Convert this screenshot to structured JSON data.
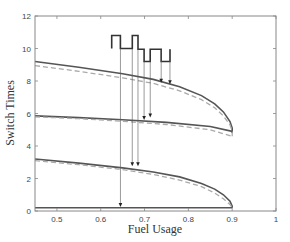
{
  "chart_data": {
    "type": "line",
    "title": "",
    "xlabel": "Fuel Usage",
    "ylabel": "Switch Times",
    "xlim": [
      0.45,
      1.0
    ],
    "ylim": [
      0,
      12
    ],
    "xticks": [
      0.5,
      0.6,
      0.7,
      0.8,
      0.9,
      1
    ],
    "xtick_labels": [
      "0.5",
      "0.6",
      "0.7",
      "0.8",
      "0.9",
      "1"
    ],
    "yticks": [
      0,
      2,
      4,
      6,
      8,
      10,
      12
    ],
    "ytick_labels": [
      "0",
      "2",
      "4",
      "6",
      "8",
      "10",
      "12"
    ],
    "grid": false,
    "legend": null,
    "series": [
      {
        "name": "switch 4 (solid)",
        "style": "solid",
        "color": "#555555",
        "x": [
          0.45,
          0.55,
          0.65,
          0.72,
          0.78,
          0.83,
          0.86,
          0.88,
          0.895,
          0.9,
          0.9
        ],
        "y": [
          9.2,
          8.85,
          8.45,
          8.1,
          7.65,
          7.1,
          6.6,
          6.1,
          5.5,
          5.1,
          4.8
        ]
      },
      {
        "name": "switch 4 (dashed)",
        "style": "dashed",
        "color": "#aaaaaa",
        "x": [
          0.45,
          0.55,
          0.65,
          0.72,
          0.78,
          0.83,
          0.86,
          0.88,
          0.895,
          0.9,
          0.9
        ],
        "y": [
          8.95,
          8.6,
          8.2,
          7.85,
          7.4,
          6.85,
          6.35,
          5.85,
          5.3,
          4.9,
          4.6
        ]
      },
      {
        "name": "switch 3 (solid)",
        "style": "solid",
        "color": "#555555",
        "x": [
          0.45,
          0.55,
          0.65,
          0.75,
          0.85,
          0.9
        ],
        "y": [
          5.85,
          5.75,
          5.62,
          5.45,
          5.2,
          4.9
        ]
      },
      {
        "name": "switch 3 (dashed)",
        "style": "dashed",
        "color": "#aaaaaa",
        "x": [
          0.45,
          0.55,
          0.65,
          0.75,
          0.85,
          0.9
        ],
        "y": [
          5.8,
          5.68,
          5.52,
          5.32,
          5.0,
          4.6
        ]
      },
      {
        "name": "switch 2 (solid)",
        "style": "solid",
        "color": "#555555",
        "x": [
          0.45,
          0.55,
          0.65,
          0.72,
          0.78,
          0.83,
          0.86,
          0.88,
          0.895,
          0.9,
          0.9
        ],
        "y": [
          3.2,
          2.95,
          2.65,
          2.4,
          2.1,
          1.7,
          1.35,
          1.0,
          0.6,
          0.3,
          0.2
        ]
      },
      {
        "name": "switch 2 (dashed)",
        "style": "dashed",
        "color": "#aaaaaa",
        "x": [
          0.45,
          0.55,
          0.65,
          0.72,
          0.78,
          0.83,
          0.86,
          0.88,
          0.895,
          0.9
        ],
        "y": [
          3.1,
          2.85,
          2.55,
          2.25,
          1.9,
          1.5,
          1.1,
          0.75,
          0.4,
          0.2
        ]
      },
      {
        "name": "switch 1 (solid)",
        "style": "solid",
        "color": "#555555",
        "x": [
          0.45,
          0.9
        ],
        "y": [
          0.2,
          0.2
        ]
      }
    ],
    "annotation": {
      "description": "Square-wave control signal with arrows projecting switch instants onto curves",
      "wave_points": [
        [
          0.625,
          10.0
        ],
        [
          0.625,
          10.8
        ],
        [
          0.645,
          10.8
        ],
        [
          0.645,
          10.0
        ],
        [
          0.672,
          10.0
        ],
        [
          0.672,
          10.8
        ],
        [
          0.685,
          10.8
        ],
        [
          0.685,
          9.95
        ],
        [
          0.699,
          9.95
        ],
        [
          0.699,
          9.2
        ],
        [
          0.713,
          9.2
        ],
        [
          0.713,
          9.95
        ],
        [
          0.738,
          9.95
        ],
        [
          0.738,
          9.2
        ],
        [
          0.758,
          9.2
        ],
        [
          0.758,
          9.95
        ]
      ],
      "arrows": [
        {
          "x": 0.645,
          "from_y": 10.0,
          "to_y": 0.25
        },
        {
          "x": 0.672,
          "from_y": 10.0,
          "to_y": 2.75
        },
        {
          "x": 0.685,
          "from_y": 9.95,
          "to_y": 2.75
        },
        {
          "x": 0.699,
          "from_y": 9.2,
          "to_y": 5.6
        },
        {
          "x": 0.713,
          "from_y": 9.2,
          "to_y": 5.75
        },
        {
          "x": 0.738,
          "from_y": 9.95,
          "to_y": 7.9
        },
        {
          "x": 0.758,
          "from_y": 9.95,
          "to_y": 7.8
        }
      ]
    }
  }
}
